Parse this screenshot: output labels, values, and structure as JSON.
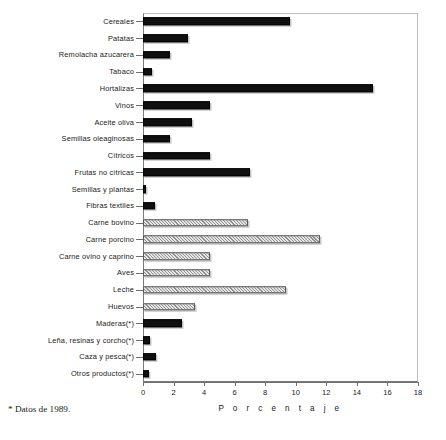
{
  "chart_data": {
    "type": "bar",
    "orientation": "horizontal",
    "title": "",
    "subtitle": "",
    "xlabel": "P o r c e n t a j e",
    "ylabel": "",
    "xlim": [
      0,
      18
    ],
    "xticks": [
      0,
      2,
      4,
      6,
      8,
      10,
      12,
      14,
      16,
      18
    ],
    "grid": false,
    "legend": null,
    "footnote": "* Datos de 1989.",
    "categories": [
      "Cereales",
      "Patatas",
      "Remolacha azucarera",
      "Tabaco",
      "Hortalizas",
      "Vinos",
      "Aceite oliva",
      "Semillas oleaginosas",
      "Cítricos",
      "Frutas no cítricas",
      "Semillas y plantas",
      "Fibras textiles",
      "Carne bovino",
      "Carne porcino",
      "Carne ovino y caprino",
      "Aves",
      "Leche",
      "Huevos",
      "Maderas(*)",
      "Leña, resinas y corcho(*)",
      "Caza y pesca(*)",
      "Otros productos(*)"
    ],
    "values": [
      9.6,
      2.95,
      1.75,
      0.6,
      15.05,
      4.4,
      3.2,
      1.75,
      4.4,
      7.0,
      0.2,
      0.8,
      6.9,
      11.6,
      4.4,
      4.4,
      9.35,
      3.4,
      2.55,
      0.45,
      0.85,
      0.4
    ],
    "bar_styles": [
      "solid-black",
      "solid-black",
      "solid-black",
      "solid-black",
      "solid-black",
      "solid-black",
      "solid-black",
      "solid-black",
      "solid-black",
      "solid-black",
      "solid-black",
      "solid-black",
      "hatched-gray",
      "hatched-gray",
      "hatched-gray",
      "hatched-gray",
      "hatched-gray",
      "hatched-gray",
      "solid-black",
      "solid-black",
      "solid-black",
      "solid-black"
    ],
    "colors": {
      "solid-black": "#101010",
      "hatched-gray": "#cfcfcf",
      "axis": "#6f6f6f",
      "background": "#ffffff",
      "text": "#1a1a1a"
    }
  }
}
